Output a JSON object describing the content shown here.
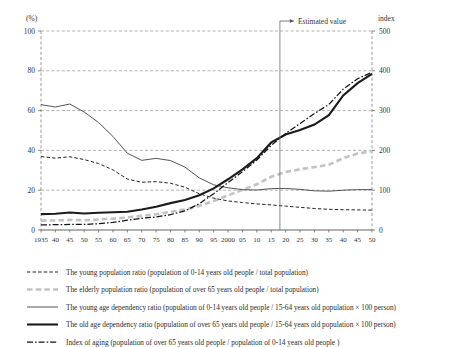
{
  "chart_data": {
    "type": "line",
    "title": "",
    "xlabel": "",
    "ylabel": "(%)",
    "y2label": "index",
    "xlim": [
      1935,
      2050
    ],
    "ylim": [
      0,
      100
    ],
    "y2lim": [
      0,
      500
    ],
    "grid": true,
    "legend_position": "below",
    "x": [
      1935,
      1940,
      1945,
      1950,
      1955,
      1960,
      1965,
      1970,
      1975,
      1980,
      1985,
      1990,
      1995,
      2000,
      2005,
      2010,
      2015,
      2020,
      2025,
      2030,
      2035,
      2040,
      2045,
      2050
    ],
    "xtick_labels": [
      "1935",
      "40",
      "45",
      "50",
      "55",
      "60",
      "65",
      "70",
      "75",
      "80",
      "85",
      "90",
      "95",
      "2000",
      "05",
      "10",
      "15",
      "20",
      "25",
      "30",
      "35",
      "40",
      "45",
      "50"
    ],
    "ytick_labels": [
      "0",
      "20",
      "40",
      "60",
      "80",
      "100"
    ],
    "ytick_values": [
      0,
      20,
      40,
      60,
      80,
      100
    ],
    "y2tick_labels": [
      "0",
      "100",
      "200",
      "300",
      "400",
      "500"
    ],
    "y2tick_values": [
      0,
      100,
      200,
      300,
      400,
      500
    ],
    "annotations": [
      {
        "text": "Estimated value",
        "at_x": 2018,
        "kind": "vertical-divider-with-arrow"
      }
    ],
    "series": [
      {
        "name": "The young population ratio (population of  0-14 years  old people / total population)",
        "key": "young_population_ratio",
        "axis": "left",
        "style": "dashed-thin-dark",
        "values": [
          36.9,
          36.1,
          36.8,
          35.4,
          33.4,
          30.2,
          25.6,
          24.0,
          24.3,
          23.5,
          21.5,
          18.2,
          16.0,
          14.6,
          13.8,
          13.1,
          12.6,
          12.0,
          11.4,
          10.8,
          10.4,
          10.2,
          10.1,
          10.0
        ]
      },
      {
        "name": "The elderly population ratio (population of  over 65 years old people / total population)",
        "key": "elderly_population_ratio",
        "axis": "left",
        "style": "dashed-thick-grey",
        "values": [
          4.7,
          4.8,
          5.1,
          4.9,
          5.3,
          5.7,
          6.3,
          7.1,
          7.9,
          9.1,
          10.3,
          12.1,
          14.6,
          17.4,
          20.2,
          23.0,
          26.8,
          29.1,
          30.5,
          31.6,
          32.8,
          36.1,
          38.4,
          39.6
        ]
      },
      {
        "name": "The young  age dependency ratio (population of  0-14 years  old people  / 15-64 years old population × 100 person)",
        "key": "young_age_dependency_ratio",
        "axis": "left",
        "style": "solid-thin",
        "values": [
          63.0,
          61.8,
          63.3,
          59.3,
          54.0,
          47.0,
          38.6,
          35.0,
          36.0,
          34.9,
          31.6,
          26.2,
          22.7,
          21.2,
          20.3,
          20.1,
          20.8,
          20.9,
          20.4,
          19.7,
          19.5,
          20.0,
          20.3,
          20.3
        ]
      },
      {
        "name": "The old age dependency ratio (population of  over 65 years old people / 15-64 years old population × 100 person)",
        "key": "old_age_dependency_ratio",
        "axis": "left",
        "style": "solid-thick",
        "values": [
          8.0,
          8.2,
          8.8,
          8.3,
          8.7,
          8.9,
          9.2,
          10.3,
          11.7,
          13.5,
          15.1,
          17.5,
          20.9,
          25.5,
          30.5,
          36.1,
          44.0,
          48.0,
          50.2,
          53.0,
          57.7,
          67.6,
          73.8,
          78.4
        ]
      },
      {
        "name": "Index of aging  (population of  over 65 years old people /  population of  0-14 years old people )",
        "key": "index_of_aging",
        "axis": "right",
        "style": "dash-dot-dark",
        "values": [
          12.8,
          13.3,
          13.9,
          13.9,
          15.9,
          18.9,
          24.6,
          29.5,
          32.5,
          38.7,
          47.9,
          66.2,
          91.2,
          119.1,
          146.5,
          175.9,
          212.8,
          242.5,
          267.5,
          292.6,
          315.4,
          354.0,
          380.2,
          396.0
        ]
      }
    ]
  },
  "axes": {
    "left_unit": "(%)",
    "right_unit": "index"
  },
  "legend": {
    "items": [
      {
        "swatch": "dashed-thin-dark",
        "label": "The young population ratio (population of  0-14 years  old people / total population)"
      },
      {
        "swatch": "dashed-thick-grey",
        "label": "The elderly population ratio (population of  over 65 years old people / total population)"
      },
      {
        "swatch": "solid-thin",
        "label": "The young  age dependency ratio (population of  0-14 years  old people  / 15-64 years old population × 100 person)"
      },
      {
        "swatch": "solid-thick",
        "label": "The old age dependency ratio (population of  over 65 years old people / 15-64 years old population × 100 person)"
      },
      {
        "swatch": "dash-dot-dark",
        "label": "Index of aging  (population of  over 65 years old people /  population of  0-14 years old people )"
      }
    ]
  },
  "annotation": {
    "estimated_value_label": "Estimated value"
  },
  "colors": {
    "young_population_ratio": "#232323",
    "elderly_population_ratio": "#c2c2c2",
    "young_age_dependency_ratio": "#4a4a4a",
    "old_age_dependency_ratio": "#1b1b1b",
    "index_of_aging": "#141414",
    "grid": "#8f8f8f",
    "axis": "#3a3a3a"
  }
}
